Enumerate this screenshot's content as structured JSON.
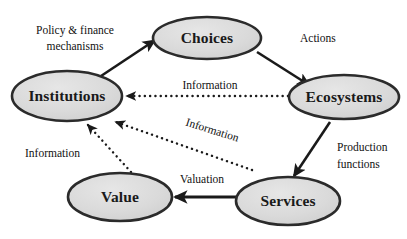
{
  "diagram": {
    "colors": {
      "node_fill": "#d9d9d9",
      "node_stroke": "#2b2b2b",
      "arrow_solid": "#1a1a1a",
      "arrow_dotted": "#1a1a1a",
      "background": "#ffffff",
      "text": "#111111"
    },
    "nodes": [
      {
        "id": "institutions",
        "label": "Institutions",
        "cx": 67,
        "cy": 96,
        "rx": 55,
        "ry": 25
      },
      {
        "id": "choices",
        "label": "Choices",
        "cx": 207,
        "cy": 38,
        "rx": 54,
        "ry": 21
      },
      {
        "id": "ecosystems",
        "label": "Ecosystems",
        "cx": 344,
        "cy": 97,
        "rx": 55,
        "ry": 22
      },
      {
        "id": "services",
        "label": "Services",
        "cx": 288,
        "cy": 201,
        "rx": 52,
        "ry": 24
      },
      {
        "id": "value",
        "label": "Value",
        "cx": 120,
        "cy": 197,
        "rx": 52,
        "ry": 24
      }
    ],
    "edges": [
      {
        "id": "institutions-to-choices",
        "from": "institutions",
        "to": "choices",
        "style": "solid",
        "label": "Policy & finance mechanisms",
        "label_lines": [
          "Policy & finance",
          "mechanisms"
        ]
      },
      {
        "id": "choices-to-ecosystems",
        "from": "choices",
        "to": "ecosystems",
        "style": "solid",
        "label": "Actions",
        "label_lines": [
          "Actions"
        ]
      },
      {
        "id": "ecosystems-to-services",
        "from": "ecosystems",
        "to": "services",
        "style": "solid",
        "label": "Production functions",
        "label_lines": [
          "Production",
          "functions"
        ]
      },
      {
        "id": "services-to-value",
        "from": "services",
        "to": "value",
        "style": "solid",
        "label": "Valuation",
        "label_lines": [
          "Valuation"
        ]
      },
      {
        "id": "ecosystems-to-institutions",
        "from": "ecosystems",
        "to": "institutions",
        "style": "dotted",
        "label": "Information",
        "label_lines": [
          "Information"
        ]
      },
      {
        "id": "services-to-institutions",
        "from": "services",
        "to": "institutions",
        "style": "dotted",
        "label": "Information",
        "label_lines": [
          "Information"
        ]
      },
      {
        "id": "value-to-institutions",
        "from": "value",
        "to": "institutions",
        "style": "dotted",
        "label": "Information",
        "label_lines": [
          "Information"
        ]
      }
    ],
    "labels": {
      "policy_line1": "Policy & finance",
      "policy_line2": "mechanisms",
      "actions": "Actions",
      "production_line1": "Production",
      "production_line2": "functions",
      "valuation": "Valuation",
      "information_top": "Information",
      "information_diagonal": "Information",
      "information_left": "Information"
    },
    "node_labels": {
      "institutions": "Institutions",
      "choices": "Choices",
      "ecosystems": "Ecosystems",
      "services": "Services",
      "value": "Value"
    }
  }
}
